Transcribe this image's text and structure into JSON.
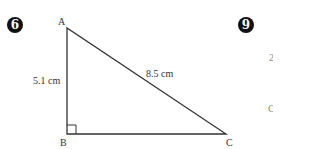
{
  "problems": [
    {
      "number": "6",
      "figure": {
        "type": "right-triangle",
        "vertices": {
          "A": "A",
          "B": "B",
          "C": "C"
        },
        "right_angle_at": "B",
        "sides": {
          "AB": "5.1 cm",
          "AC": "8.5 cm"
        }
      }
    },
    {
      "number": "9",
      "partial_labels": [
        "2",
        "C"
      ]
    }
  ]
}
